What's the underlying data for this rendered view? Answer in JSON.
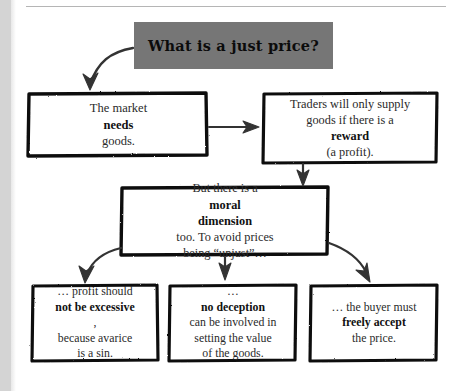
{
  "page": {
    "kind": "flowchart-diagram",
    "background_color": "#ffffff",
    "ink_color": "#111111",
    "title_fill_color": "#767676"
  },
  "title": {
    "text": "What is a just price?"
  },
  "nodes": [
    {
      "id": "market",
      "lines": [
        {
          "parts": [
            {
              "t": "The market ",
              "bold": false
            },
            {
              "t": "needs",
              "bold": true
            },
            {
              "t": " goods.",
              "bold": false
            }
          ]
        }
      ]
    },
    {
      "id": "traders",
      "lines": [
        {
          "parts": [
            {
              "t": "Traders will only supply",
              "bold": false
            }
          ]
        },
        {
          "parts": [
            {
              "t": "goods if there is a",
              "bold": false
            }
          ]
        },
        {
          "parts": [
            {
              "t": "reward",
              "bold": true
            },
            {
              "t": " (a profit).",
              "bold": false
            }
          ]
        }
      ]
    },
    {
      "id": "moral",
      "lines": [
        {
          "parts": [
            {
              "t": "But there is a ",
              "bold": false
            },
            {
              "t": "moral",
              "bold": true
            }
          ]
        },
        {
          "parts": [
            {
              "t": "dimension",
              "bold": true
            },
            {
              "t": " too. To avoid prices",
              "bold": false
            }
          ]
        },
        {
          "parts": [
            {
              "t": "being “unjust”…",
              "bold": false
            }
          ]
        }
      ]
    },
    {
      "id": "profit",
      "lines": [
        {
          "parts": [
            {
              "t": "… profit should",
              "bold": false
            }
          ]
        },
        {
          "parts": [
            {
              "t": "not be excessive",
              "bold": true
            },
            {
              "t": ",",
              "bold": false
            }
          ]
        },
        {
          "parts": [
            {
              "t": "because avarice",
              "bold": false
            }
          ]
        },
        {
          "parts": [
            {
              "t": "is a sin.",
              "bold": false
            }
          ]
        }
      ]
    },
    {
      "id": "deception",
      "lines": [
        {
          "parts": [
            {
              "t": "… ",
              "bold": false
            },
            {
              "t": "no deception",
              "bold": true
            }
          ]
        },
        {
          "parts": [
            {
              "t": "can be involved in",
              "bold": false
            }
          ]
        },
        {
          "parts": [
            {
              "t": "setting the value",
              "bold": false
            }
          ]
        },
        {
          "parts": [
            {
              "t": "of the goods.",
              "bold": false
            }
          ]
        }
      ]
    },
    {
      "id": "buyer",
      "lines": [
        {
          "parts": [
            {
              "t": "… the buyer must",
              "bold": false
            }
          ]
        },
        {
          "parts": [
            {
              "t": "freely accept",
              "bold": true
            }
          ]
        },
        {
          "parts": [
            {
              "t": "the price.",
              "bold": false
            }
          ]
        }
      ]
    }
  ],
  "connectors": [
    {
      "id": "title-to-market",
      "style": "curved",
      "from": "title",
      "to": "market"
    },
    {
      "id": "market-to-traders",
      "style": "straight",
      "from": "market",
      "to": "traders"
    },
    {
      "id": "traders-to-moral",
      "style": "straight",
      "from": "traders",
      "to": "moral"
    },
    {
      "id": "moral-to-profit",
      "style": "curved",
      "from": "moral",
      "to": "profit"
    },
    {
      "id": "moral-to-deception",
      "style": "straight",
      "from": "moral",
      "to": "deception"
    },
    {
      "id": "moral-to-buyer",
      "style": "curved",
      "from": "moral",
      "to": "buyer"
    }
  ]
}
